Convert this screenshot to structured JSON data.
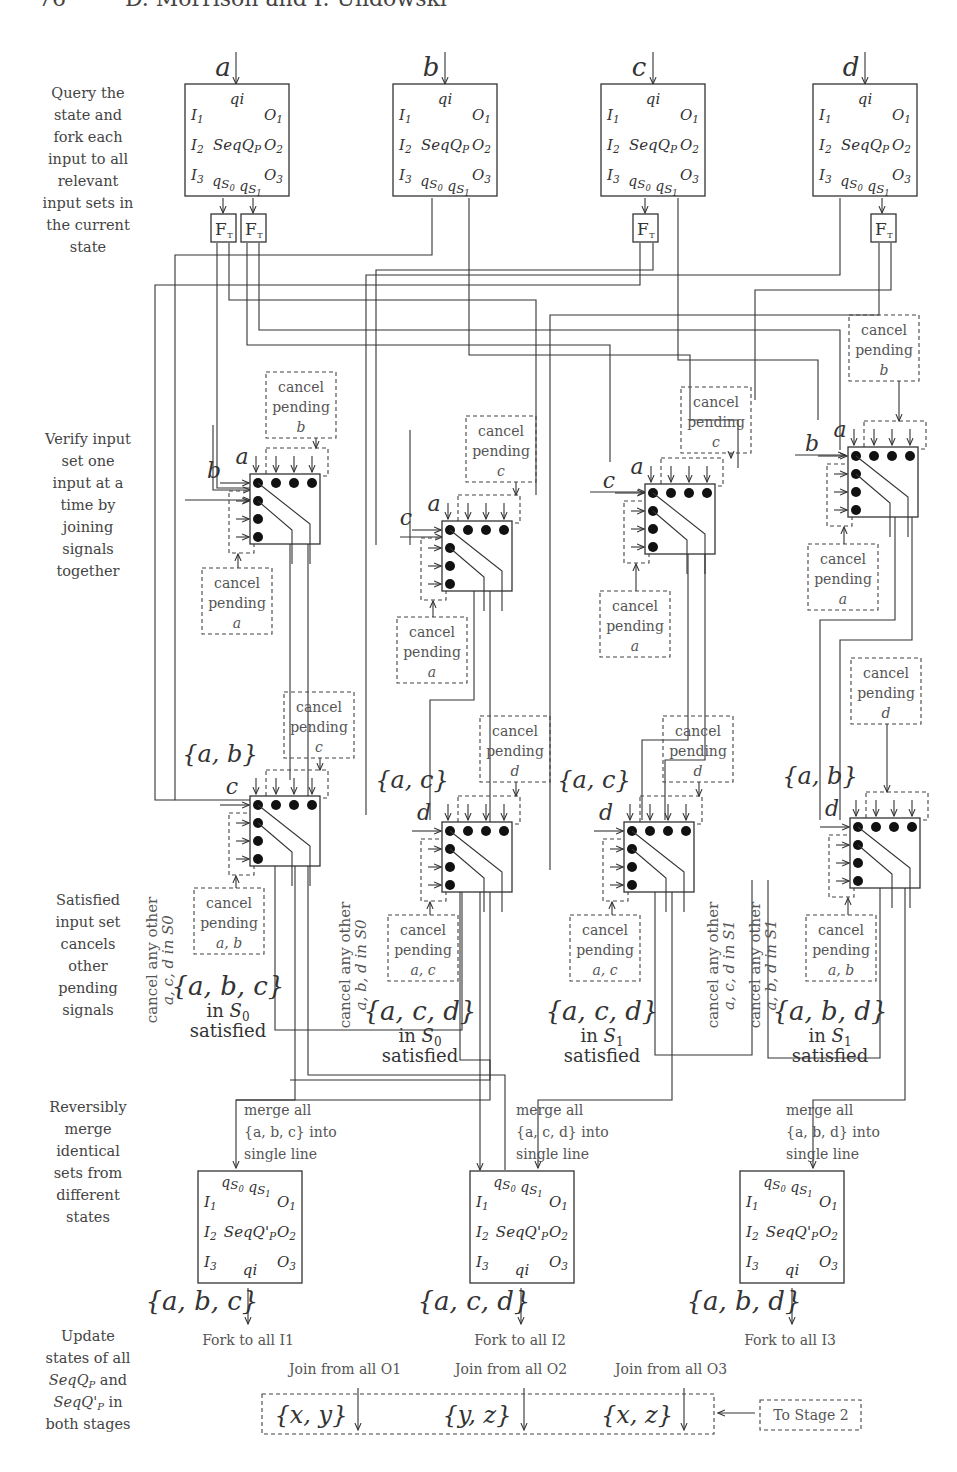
{
  "header": {
    "page_number": "76",
    "authors": "D. Morrison and I. Ulidowski"
  },
  "stage_descriptions": [
    {
      "id": "query",
      "lines": [
        "Query the",
        "state and",
        "fork each",
        "input to all",
        "relevant",
        "input sets in",
        "the current",
        "state"
      ]
    },
    {
      "id": "verify",
      "lines": [
        "Verify input",
        "set one",
        "input at a",
        "time by",
        "joining",
        "signals",
        "together"
      ]
    },
    {
      "id": "satisfied",
      "lines": [
        "Satisfied",
        "input set",
        "cancels",
        "other",
        "pending",
        "signals"
      ]
    },
    {
      "id": "merge",
      "lines": [
        "Reversibly",
        "merge",
        "identical",
        "sets from",
        "different",
        "states"
      ]
    },
    {
      "id": "update",
      "lines": [
        "Update",
        "states of all",
        "SeqQ_P and",
        "SeqQ'_P in",
        "both stages"
      ]
    }
  ],
  "query_blocks": [
    {
      "input": "a",
      "top": "qi",
      "name": "SeqQ_P",
      "left_ports": [
        "I1",
        "I2",
        "I3"
      ],
      "right_ports": [
        "O1",
        "O2",
        "O3"
      ],
      "bottom": "qS0 qS1",
      "forks": 2
    },
    {
      "input": "b",
      "top": "qi",
      "name": "SeqQ_P",
      "left_ports": [
        "I1",
        "I2",
        "I3"
      ],
      "right_ports": [
        "O1",
        "O2",
        "O3"
      ],
      "bottom": "qS0 qS1",
      "forks": 0
    },
    {
      "input": "c",
      "top": "qi",
      "name": "SeqQ_P",
      "left_ports": [
        "I1",
        "I2",
        "I3"
      ],
      "right_ports": [
        "O1",
        "O2",
        "O3"
      ],
      "bottom": "qS0 qS1",
      "forks": 1
    },
    {
      "input": "d",
      "top": "qi",
      "name": "SeqQ_P",
      "left_ports": [
        "I1",
        "I2",
        "I3"
      ],
      "right_ports": [
        "O1",
        "O2",
        "O3"
      ],
      "bottom": "qS0 qS1",
      "forks": 1
    }
  ],
  "fork_label": "F",
  "fork_sub": "T",
  "join_row1": [
    {
      "top_in": "a",
      "left_in": "b",
      "cancel_top": [
        "cancel",
        "pending",
        "b"
      ],
      "cancel_bottom": [
        "cancel",
        "pending",
        "a"
      ]
    },
    {
      "top_in": "a",
      "left_in": "c",
      "cancel_top": [
        "cancel",
        "pending",
        "c"
      ],
      "cancel_bottom": [
        "cancel",
        "pending",
        "a"
      ]
    },
    {
      "top_in": "a",
      "left_in": "c",
      "cancel_top": [
        "cancel",
        "pending",
        "c"
      ],
      "cancel_bottom": [
        "cancel",
        "pending",
        "a"
      ]
    },
    {
      "top_in": "a",
      "left_in": "b",
      "cancel_top": [
        "cancel",
        "pending",
        "b"
      ],
      "cancel_bottom": [
        "cancel",
        "pending",
        "a"
      ]
    }
  ],
  "join_row2": [
    {
      "set": "{a, b}",
      "left_in": "c",
      "cancel_top": [
        "cancel",
        "pending",
        "c"
      ],
      "cancel_bottom": [
        "cancel",
        "pending",
        "a, b"
      ]
    },
    {
      "set": "{a, c}",
      "left_in": "d",
      "cancel_top": [
        "cancel",
        "pending",
        "d"
      ],
      "cancel_bottom": [
        "cancel",
        "pending",
        "a, c"
      ]
    },
    {
      "set": "{a, c}",
      "left_in": "d",
      "cancel_top": [
        "cancel",
        "pending",
        "d"
      ],
      "cancel_bottom": [
        "cancel",
        "pending",
        "a, c"
      ]
    },
    {
      "set": "{a, b}",
      "left_in": "d",
      "cancel_top": [
        "cancel",
        "pending",
        "d"
      ],
      "cancel_bottom": [
        "cancel",
        "pending",
        "a, b"
      ]
    }
  ],
  "satisfied": [
    {
      "set": "{a, b, c}",
      "state": "in S0",
      "word": "satisfied",
      "cancel_any": [
        "cancel any other",
        "a, c, d in S0"
      ]
    },
    {
      "set": "{a, c, d}",
      "state": "in S0",
      "word": "satisfied",
      "cancel_any": [
        "cancel any other",
        "a, b, d in S0"
      ]
    },
    {
      "set": "{a, c, d}",
      "state": "in S1",
      "word": "satisfied",
      "cancel_any": [
        "cancel any other",
        "a, c, d in S1"
      ]
    },
    {
      "set": "{a, b, d}",
      "state": "in S1",
      "word": "satisfied",
      "cancel_any": [
        "cancel any other",
        "a, b, d in S1"
      ]
    }
  ],
  "merge_blocks": [
    {
      "note": [
        "merge all",
        "{a, b, c} into",
        "single line"
      ],
      "top": "qS0 qS1",
      "name": "SeqQ'_P",
      "left_ports": [
        "I1",
        "I2",
        "I3"
      ],
      "right_ports": [
        "O1",
        "O2",
        "O3"
      ],
      "bottom": "qi",
      "out_set": "{a, b, c}",
      "fork": "Fork to all I1"
    },
    {
      "note": [
        "merge all",
        "{a, c, d} into",
        "single line"
      ],
      "top": "qS0 qS1",
      "name": "SeqQ'_P",
      "left_ports": [
        "I1",
        "I2",
        "I3"
      ],
      "right_ports": [
        "O1",
        "O2",
        "O3"
      ],
      "bottom": "qi",
      "out_set": "{a, c, d}",
      "fork": "Fork to all I2"
    },
    {
      "note": [
        "merge all",
        "{a, b, d} into",
        "single line"
      ],
      "top": "qS0 qS1",
      "name": "SeqQ'_P",
      "left_ports": [
        "I1",
        "I2",
        "I3"
      ],
      "right_ports": [
        "O1",
        "O2",
        "O3"
      ],
      "bottom": "qi",
      "out_set": "{a, b, d}",
      "fork": "Fork to all I3"
    }
  ],
  "join_outputs": [
    {
      "label": "Join from all O1",
      "set": "{x, y}"
    },
    {
      "label": "Join from all O2",
      "set": "{y, z}"
    },
    {
      "label": "Join from all O3",
      "set": "{x, z}"
    }
  ],
  "to_stage_2": "To Stage 2"
}
